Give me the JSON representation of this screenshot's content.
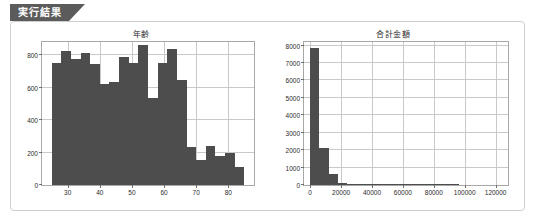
{
  "window": {
    "tab_label": "実行結果"
  },
  "charts": [
    {
      "id": "age",
      "title": "年齢",
      "xticks": [
        "30",
        "40",
        "50",
        "60",
        "70",
        "80"
      ],
      "yticks": [
        "0",
        "200",
        "400",
        "600",
        "800"
      ]
    },
    {
      "id": "total-amount",
      "title": "合計金額",
      "xticks": [
        "0",
        "20000",
        "40000",
        "60000",
        "80000",
        "100000",
        "120000"
      ],
      "yticks": [
        "0",
        "1000",
        "2000",
        "3000",
        "4000",
        "5000",
        "6000",
        "7000",
        "8000"
      ]
    }
  ],
  "chart_data": [
    {
      "type": "bar",
      "id": "age",
      "title": "年齢",
      "xlabel": "",
      "ylabel": "",
      "grid": true,
      "legend": null,
      "xlim": [
        22,
        88
      ],
      "ylim": [
        0,
        880
      ],
      "xticks": [
        30,
        40,
        50,
        60,
        70,
        80
      ],
      "yticks": [
        0,
        200,
        400,
        600,
        800
      ],
      "bin_edges": [
        25,
        28,
        31,
        34,
        37,
        40,
        43,
        46,
        49,
        52,
        55,
        58,
        61,
        64,
        67,
        70,
        73,
        76,
        79,
        82,
        85
      ],
      "bin_centers": [
        26.5,
        29.5,
        32.5,
        35.5,
        38.5,
        41.5,
        44.5,
        47.5,
        50.5,
        53.5,
        56.5,
        59.5,
        62.5,
        65.5,
        68.5,
        71.5,
        74.5,
        77.5,
        80.5,
        83.5
      ],
      "values": [
        752,
        822,
        776,
        814,
        742,
        624,
        634,
        790,
        752,
        862,
        534,
        750,
        836,
        648,
        234,
        154,
        240,
        178,
        200,
        110
      ]
    },
    {
      "type": "bar",
      "id": "total-amount",
      "title": "合計金額",
      "xlabel": "",
      "ylabel": "",
      "grid": true,
      "legend": null,
      "xlim": [
        -4000,
        128000
      ],
      "ylim": [
        0,
        8200
      ],
      "xticks": [
        0,
        20000,
        40000,
        60000,
        80000,
        100000,
        120000
      ],
      "yticks": [
        0,
        1000,
        2000,
        3000,
        4000,
        5000,
        6000,
        7000,
        8000
      ],
      "bin_edges": [
        0,
        6000,
        12000,
        18000,
        24000,
        30000,
        36000,
        42000,
        48000,
        54000,
        60000,
        66000,
        72000,
        78000,
        84000,
        90000,
        96000,
        102000,
        108000,
        114000,
        120000
      ],
      "bin_centers": [
        3000,
        9000,
        15000,
        21000,
        27000,
        33000,
        39000,
        45000,
        51000,
        57000,
        63000,
        69000,
        75000,
        81000,
        87000,
        93000,
        99000,
        105000,
        111000,
        117000
      ],
      "values": [
        7850,
        2110,
        620,
        135,
        80,
        18,
        10,
        6,
        4,
        3,
        2,
        2,
        1,
        1,
        1,
        1,
        0,
        0,
        0,
        0
      ]
    }
  ],
  "colors": {
    "tab_background": "#5b5b5b",
    "tab_text": "#ffffff",
    "panel_border": "#cfcfcf",
    "bar_fill": "#4d4d4d",
    "grid": "#c9c9c9",
    "axis": "#a8a8a8"
  }
}
